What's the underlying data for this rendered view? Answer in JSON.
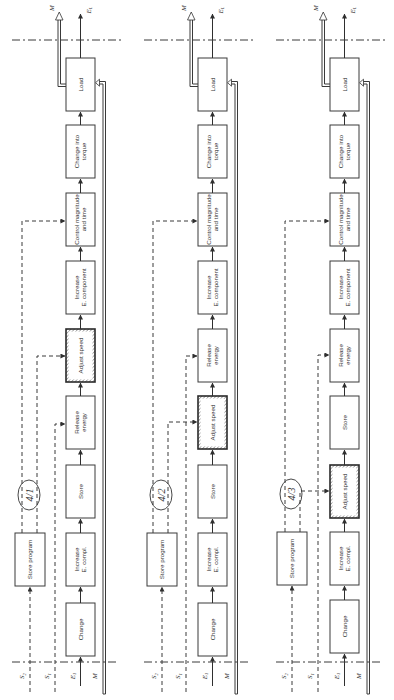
{
  "figure": {
    "orientation": "rotated 90deg counter-clockwise (flow runs bottom to top)",
    "colors": {
      "ink": "#333333",
      "background": "#ffffff",
      "hatch": "#555555"
    },
    "input_labels": {
      "S2": "S",
      "S2_sub": "2",
      "S1": "S",
      "S1_sub": "1",
      "E1": "E",
      "E1_sub": "1",
      "M_in": "M"
    },
    "output_labels": {
      "M_out": "M",
      "EL": "E",
      "EL_sub": "L"
    },
    "panels": [
      {
        "id": "4/1",
        "x": 66,
        "store_program": {
          "label": "Store program",
          "x": 15,
          "y": 533
        },
        "blocks": [
          {
            "lines": [
              "Change"
            ],
            "y": 603,
            "hatched": false
          },
          {
            "lines": [
              "Increase",
              "E. compl."
            ],
            "y": 533,
            "hatched": false
          },
          {
            "lines": [
              "Store"
            ],
            "y": 465,
            "hatched": false
          },
          {
            "lines": [
              "Release",
              "energy"
            ],
            "y": 396,
            "hatched": false
          },
          {
            "lines": [
              "Adjust speed"
            ],
            "y": 329,
            "hatched": true
          },
          {
            "lines": [
              "Increase",
              "E. component"
            ],
            "y": 261,
            "hatched": false
          },
          {
            "lines": [
              "Control magnitude",
              "and time"
            ],
            "y": 193,
            "hatched": false
          },
          {
            "lines": [
              "Change into",
              "torque"
            ],
            "y": 125,
            "hatched": false
          },
          {
            "lines": [
              "Load"
            ],
            "y": 58,
            "hatched": false
          }
        ],
        "controls": [
          {
            "from": "S2",
            "x": 22,
            "target_y": 221
          },
          {
            "from": "store_program",
            "x": 37,
            "target_y": 356
          },
          {
            "from": "S1",
            "x": 55,
            "target_y": 424
          }
        ]
      },
      {
        "id": "4/2",
        "x": 198,
        "store_program": {
          "label": "Store program",
          "x": 147,
          "y": 533
        },
        "blocks": [
          {
            "lines": [
              "Change"
            ],
            "y": 603,
            "hatched": false
          },
          {
            "lines": [
              "Increase",
              "E. compl."
            ],
            "y": 533,
            "hatched": false
          },
          {
            "lines": [
              "Store"
            ],
            "y": 465,
            "hatched": false
          },
          {
            "lines": [
              "Adjust speed"
            ],
            "y": 396,
            "hatched": true
          },
          {
            "lines": [
              "Release",
              "energy"
            ],
            "y": 329,
            "hatched": false
          },
          {
            "lines": [
              "Increase",
              "E. component"
            ],
            "y": 261,
            "hatched": false
          },
          {
            "lines": [
              "Control magnitude",
              "and time"
            ],
            "y": 193,
            "hatched": false
          },
          {
            "lines": [
              "Change into",
              "torque"
            ],
            "y": 125,
            "hatched": false
          },
          {
            "lines": [
              "Load"
            ],
            "y": 58,
            "hatched": false
          }
        ],
        "controls": [
          {
            "from": "S2",
            "x": 153,
            "target_y": 221
          },
          {
            "from": "store_program",
            "x": 168,
            "target_y": 422
          },
          {
            "from": "S1",
            "x": 186,
            "target_y": 356
          }
        ]
      },
      {
        "id": "4/3",
        "x": 330,
        "store_program": {
          "label": "Store program",
          "x": 277,
          "y": 532
        },
        "blocks": [
          {
            "lines": [
              "Change"
            ],
            "y": 600,
            "hatched": false
          },
          {
            "lines": [
              "Increase",
              "E. compl."
            ],
            "y": 532,
            "hatched": false
          },
          {
            "lines": [
              "Adjust speed"
            ],
            "y": 465,
            "hatched": true
          },
          {
            "lines": [
              "Store"
            ],
            "y": 396,
            "hatched": false
          },
          {
            "lines": [
              "Release",
              "energy"
            ],
            "y": 329,
            "hatched": false
          },
          {
            "lines": [
              "Increase",
              "E. component"
            ],
            "y": 261,
            "hatched": false
          },
          {
            "lines": [
              "Control magnitude",
              "and time"
            ],
            "y": 193,
            "hatched": false
          },
          {
            "lines": [
              "Change into",
              "torque"
            ],
            "y": 125,
            "hatched": false
          },
          {
            "lines": [
              "Load"
            ],
            "y": 58,
            "hatched": false
          }
        ],
        "controls": [
          {
            "from": "S2",
            "x": 285,
            "target_y": 221
          },
          {
            "from": "store_program",
            "x": 300,
            "target_y": 491
          },
          {
            "from": "S1",
            "x": 318,
            "target_y": 355
          }
        ]
      }
    ]
  }
}
